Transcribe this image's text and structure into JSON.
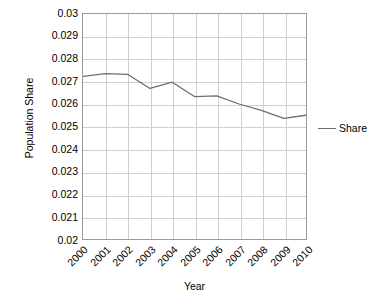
{
  "chart_data": {
    "type": "line",
    "title": "",
    "xlabel": "Year",
    "ylabel": "Population Share",
    "categories": [
      "2000",
      "2001",
      "2002",
      "2003",
      "2004",
      "2005",
      "2006",
      "2007",
      "2008",
      "2009",
      "2010"
    ],
    "x": [
      2000,
      2001,
      2002,
      2003,
      2004,
      2005,
      2006,
      2007,
      2008,
      2009,
      2010
    ],
    "series": [
      {
        "name": "Share",
        "color": "#6e6e6e",
        "values": [
          0.02723,
          0.02735,
          0.02732,
          0.02669,
          0.02697,
          0.02633,
          0.02636,
          0.026,
          0.02572,
          0.02536,
          0.0255
        ]
      }
    ],
    "ylim": [
      0.02,
      0.03
    ],
    "ytick_step": 0.001,
    "yticks": [
      0.03,
      0.029,
      0.028,
      0.027,
      0.026,
      0.025,
      0.024,
      0.023,
      0.022,
      0.021,
      0.02
    ],
    "ytick_labels": [
      "0.03",
      "0.029",
      "0.028",
      "0.027",
      "0.026",
      "0.025",
      "0.024",
      "0.023",
      "0.022",
      "0.021",
      "0.02"
    ],
    "grid": true,
    "grid_color": "#cfcfcf",
    "axis_color": "#9a9a9a",
    "legend_position": "right",
    "legend_entries": [
      "Share"
    ],
    "background": "#ffffff",
    "xtick_rotation": -45
  },
  "legend": {
    "share_label": "Share"
  },
  "axes": {
    "x_title": "Year",
    "y_title": "Population Share"
  }
}
